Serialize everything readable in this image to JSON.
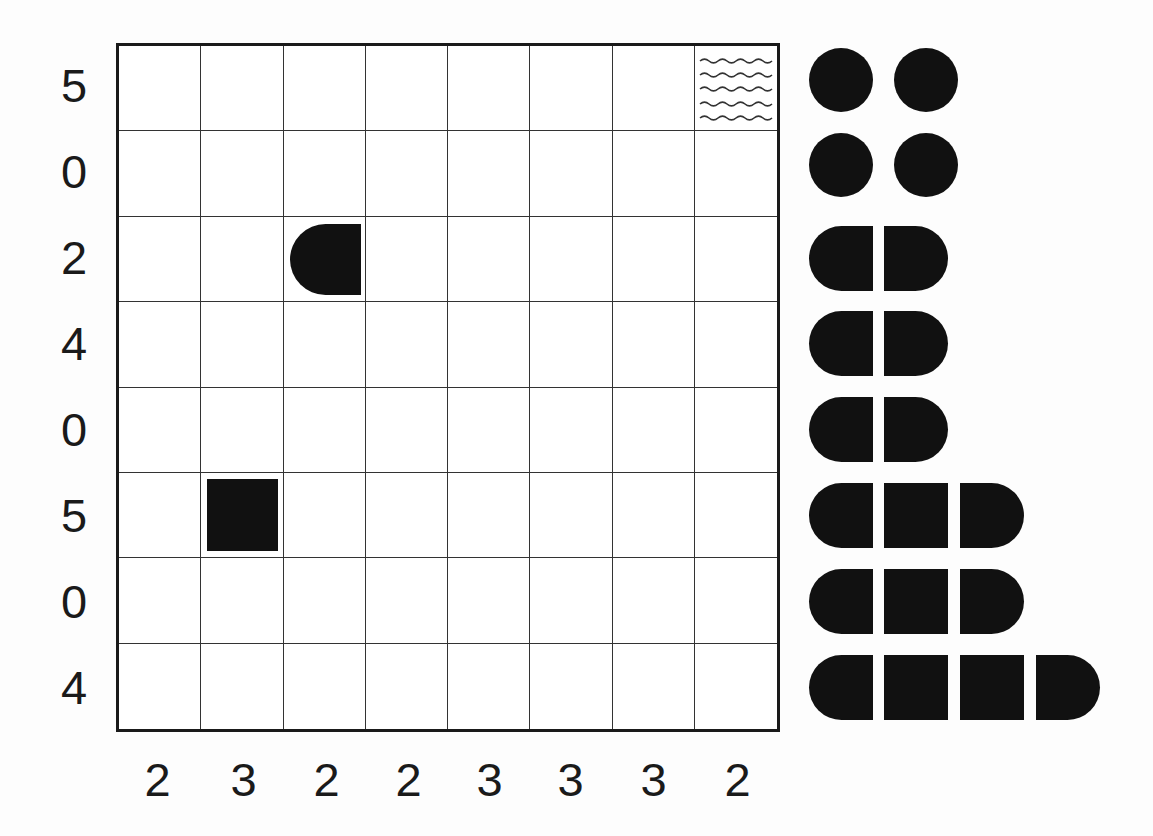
{
  "puzzle": {
    "type": "battleships",
    "rows": 8,
    "cols": 8,
    "row_clues": [
      "5",
      "0",
      "2",
      "4",
      "0",
      "5",
      "0",
      "4"
    ],
    "col_clues": [
      "2",
      "3",
      "2",
      "2",
      "3",
      "3",
      "3",
      "2"
    ],
    "given_cells": [
      {
        "row": 0,
        "col": 7,
        "kind": "water",
        "icon": "water-waves-icon"
      },
      {
        "row": 2,
        "col": 2,
        "kind": "ship-end-left",
        "icon": "ship-end-left-icon"
      },
      {
        "row": 5,
        "col": 1,
        "kind": "ship-middle",
        "icon": "ship-middle-square-icon"
      }
    ]
  },
  "fleet": {
    "ships": [
      {
        "length": 1,
        "segments": [
          "sub"
        ],
        "row": 0,
        "col": 0
      },
      {
        "length": 1,
        "segments": [
          "sub"
        ],
        "row": 0,
        "col": 1
      },
      {
        "length": 1,
        "segments": [
          "sub"
        ],
        "row": 1,
        "col": 0
      },
      {
        "length": 1,
        "segments": [
          "sub"
        ],
        "row": 1,
        "col": 1
      },
      {
        "length": 2,
        "segments": [
          "left",
          "right"
        ],
        "row": 2
      },
      {
        "length": 2,
        "segments": [
          "left",
          "right"
        ],
        "row": 3
      },
      {
        "length": 2,
        "segments": [
          "left",
          "right"
        ],
        "row": 4
      },
      {
        "length": 3,
        "segments": [
          "left",
          "mid",
          "right"
        ],
        "row": 5
      },
      {
        "length": 3,
        "segments": [
          "left",
          "mid",
          "right"
        ],
        "row": 6
      },
      {
        "length": 4,
        "segments": [
          "left",
          "mid",
          "mid",
          "right"
        ],
        "row": 7
      }
    ]
  },
  "colors": {
    "background": "#fdfdfd",
    "ink": "#111111",
    "grid_line": "#333333"
  }
}
